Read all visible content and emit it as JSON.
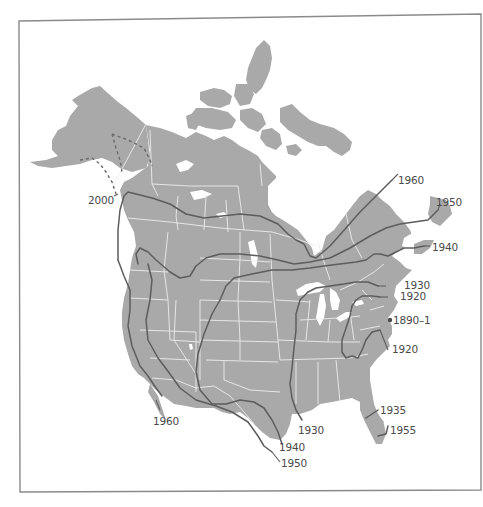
{
  "map": {
    "region": "North America",
    "colors": {
      "land": "#a9a9a9",
      "water": "#ffffff",
      "borders": "#ececec",
      "isochrones": "#5d5d5d",
      "labels": "#4a4a4a",
      "frame": "#8a8a8a"
    },
    "origin": {
      "label": "1890–1",
      "marker": "dot",
      "location_hint": "New York"
    },
    "isochrones": [
      {
        "year": "2000",
        "label": "2000",
        "style": "dashed",
        "location_hint": "Alaska / Yukon"
      },
      {
        "year": "1960",
        "label": "1960",
        "style": "solid",
        "location_hint": "Northern Canada to Labrador"
      },
      {
        "year": "1960",
        "label": "1960",
        "style": "solid",
        "location_hint": "Pacific coast (California)"
      },
      {
        "year": "1950",
        "label": "1950",
        "style": "solid",
        "location_hint": "Newfoundland"
      },
      {
        "year": "1950",
        "label": "1950",
        "style": "solid",
        "location_hint": "Mexico border / Texas"
      },
      {
        "year": "1940",
        "label": "1940",
        "style": "solid",
        "location_hint": "Nova Scotia"
      },
      {
        "year": "1940",
        "label": "1940",
        "style": "solid",
        "location_hint": "South Texas"
      },
      {
        "year": "1935",
        "label": "1935",
        "style": "solid",
        "location_hint": "North Florida"
      },
      {
        "year": "1955",
        "label": "1955",
        "style": "solid",
        "location_hint": "South Florida"
      },
      {
        "year": "1930",
        "label": "1930",
        "style": "solid",
        "location_hint": "New England"
      },
      {
        "year": "1930",
        "label": "1930",
        "style": "solid",
        "location_hint": "Louisiana"
      },
      {
        "year": "1920",
        "label": "1920",
        "style": "solid",
        "location_hint": "Maine"
      },
      {
        "year": "1920",
        "label": "1920",
        "style": "solid",
        "location_hint": "Virginia / North Carolina"
      }
    ],
    "labels": {
      "l2000": "2000",
      "l1960n": "1960",
      "l1950n": "1950",
      "l1940n": "1940",
      "l1930n": "1930",
      "l1920n": "1920",
      "l1890": "1890–1",
      "l1920s": "1920",
      "l1935": "1935",
      "l1955": "1955",
      "l1930s": "1930",
      "l1940s": "1940",
      "l1950s": "1950",
      "l1960w": "1960"
    }
  }
}
